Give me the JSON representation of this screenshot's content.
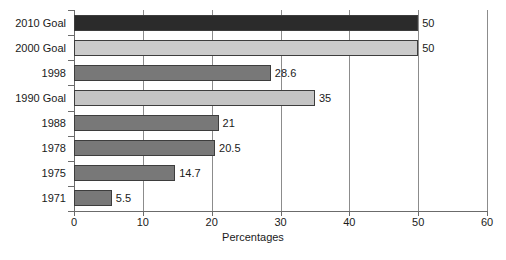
{
  "chart_data": {
    "type": "bar",
    "orientation": "horizontal",
    "title": "",
    "xlabel": "Percentages",
    "ylabel": "",
    "xlim": [
      0,
      60
    ],
    "xticks": [
      0,
      10,
      20,
      30,
      40,
      50,
      60
    ],
    "xtick_labels": [
      "0",
      "10",
      "20",
      "30",
      "40",
      "50",
      "60"
    ],
    "grid": true,
    "grid_axis": "x",
    "legend": "none",
    "categories": [
      "2010 Goal",
      "2000 Goal",
      "1998",
      "1990 Goal",
      "1988",
      "1978",
      "1975",
      "1971"
    ],
    "values": [
      50,
      50,
      28.6,
      35,
      21,
      20.5,
      14.7,
      5.5
    ],
    "value_labels": [
      "50",
      "50",
      "28.6",
      "35",
      "21",
      "20.5",
      "14.7",
      "5.5"
    ],
    "bar_colors": [
      "#2b2b2b",
      "#cbcbcb",
      "#787878",
      "#c4c4c4",
      "#787878",
      "#787878",
      "#787878",
      "#787878"
    ],
    "bar_edge_color": "#3d3d3d",
    "series": [
      {
        "name": "Percentages",
        "points": [
          {
            "category": "2010 Goal",
            "value": 50,
            "label": "50",
            "color": "#2b2b2b"
          },
          {
            "category": "2000 Goal",
            "value": 50,
            "label": "50",
            "color": "#cbcbcb"
          },
          {
            "category": "1998",
            "value": 28.6,
            "label": "28.6",
            "color": "#787878"
          },
          {
            "category": "1990 Goal",
            "value": 35,
            "label": "35",
            "color": "#c4c4c4"
          },
          {
            "category": "1988",
            "value": 21,
            "label": "21",
            "color": "#787878"
          },
          {
            "category": "1978",
            "value": 20.5,
            "label": "20.5",
            "color": "#787878"
          },
          {
            "category": "1975",
            "value": 14.7,
            "label": "14.7",
            "color": "#787878"
          },
          {
            "category": "1971",
            "value": 5.5,
            "label": "5.5",
            "color": "#787878"
          }
        ]
      }
    ]
  },
  "caption": {
    "text": ""
  }
}
